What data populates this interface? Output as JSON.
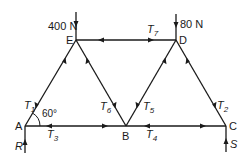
{
  "figure": {
    "type": "pin-jointed truss",
    "colors": {
      "line": "#1a1a1a",
      "background": "#ffffff"
    }
  },
  "nodes": {
    "A": {
      "label": "A",
      "x": 25,
      "y": 126
    },
    "B": {
      "label": "B",
      "x": 126,
      "y": 126
    },
    "C": {
      "label": "C",
      "x": 226,
      "y": 126
    },
    "D": {
      "label": "D",
      "x": 176,
      "y": 40
    },
    "E": {
      "label": "E",
      "x": 76,
      "y": 40
    }
  },
  "members": [
    {
      "name": "T",
      "sub": "1",
      "from": "A",
      "to": "E"
    },
    {
      "name": "T",
      "sub": "2",
      "from": "C",
      "to": "D"
    },
    {
      "name": "T",
      "sub": "3",
      "from": "A",
      "to": "B"
    },
    {
      "name": "T",
      "sub": "4",
      "from": "B",
      "to": "C"
    },
    {
      "name": "T",
      "sub": "5",
      "from": "B",
      "to": "D"
    },
    {
      "name": "T",
      "sub": "6",
      "from": "B",
      "to": "E"
    },
    {
      "name": "T",
      "sub": "7",
      "from": "E",
      "to": "D"
    }
  ],
  "loads": [
    {
      "label": "400 N",
      "at": "E",
      "direction": "down"
    },
    {
      "label": "80 N",
      "at": "D",
      "direction": "down"
    }
  ],
  "reactions": [
    {
      "label": "R",
      "at": "A",
      "direction": "up"
    },
    {
      "label": "S",
      "at": "C",
      "direction": "up"
    }
  ],
  "angle": {
    "label": "60°",
    "at": "A",
    "between": "AE and AB"
  }
}
